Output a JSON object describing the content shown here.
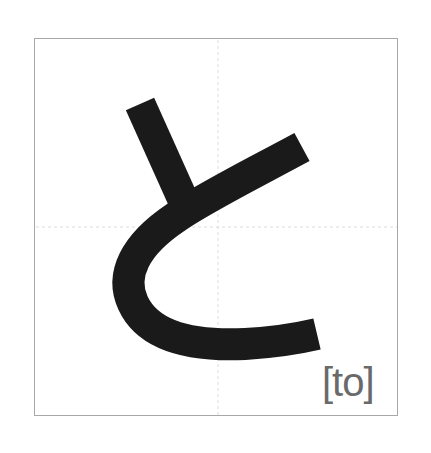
{
  "card": {
    "character": "と",
    "romaji": "[to]",
    "colors": {
      "stroke": "#1a1a1a",
      "border": "#a8a8a8",
      "guide": "#d8d8d8",
      "romaji": "#6a6a6a"
    }
  }
}
